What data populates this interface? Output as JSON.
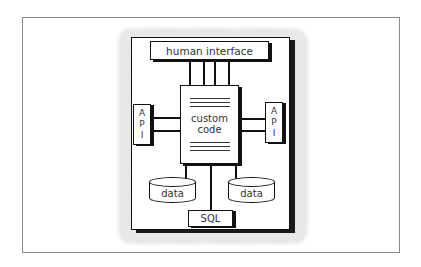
{
  "diagram": {
    "title": "",
    "nodes": {
      "human_interface": "human interface",
      "custom_code_line1": "custom",
      "custom_code_line2": "code",
      "api_left": [
        "A",
        "P",
        "I"
      ],
      "api_right": [
        "A",
        "P",
        "I"
      ],
      "data_left": "data",
      "data_right": "data",
      "sql": "SQL"
    },
    "edges": [
      {
        "from": "human interface",
        "to": "custom code",
        "count": 4
      },
      {
        "from": "API (left)",
        "to": "custom code",
        "count": 2
      },
      {
        "from": "API (right)",
        "to": "custom code",
        "count": 2
      },
      {
        "from": "custom code",
        "to": "data (left)",
        "count": 1
      },
      {
        "from": "custom code",
        "to": "data (right)",
        "count": 1
      },
      {
        "from": "custom code",
        "to": "SQL",
        "count": 1
      }
    ]
  }
}
